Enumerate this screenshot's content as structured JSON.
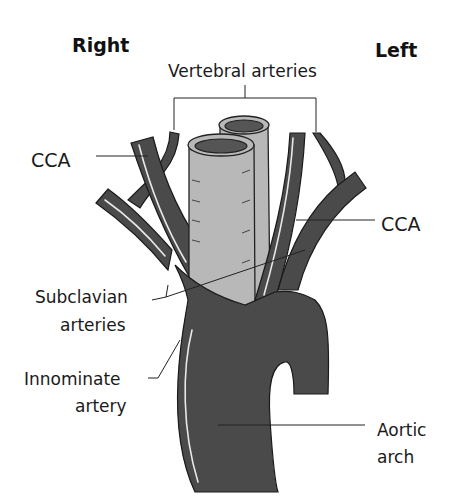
{
  "diagram": {
    "title_left_side": "Right",
    "title_right_side": "Left",
    "labels": {
      "vertebral": "Vertebral arteries",
      "cca_right": "CCA",
      "cca_left": "CCA",
      "subclavian_line1": "Subclavian",
      "subclavian_line2": "arteries",
      "innominate_line1": "Innominate",
      "innominate_line2": "artery",
      "aortic_line1": "Aortic",
      "aortic_line2": "arch"
    },
    "colors": {
      "artery": "#4a4a4a",
      "trachea": "#b8b8b8",
      "background": "#ffffff"
    }
  }
}
